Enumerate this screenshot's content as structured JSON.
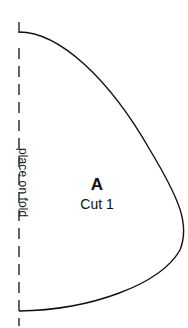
{
  "pattern_piece": {
    "letter": "A",
    "cut_instruction": "Cut 1",
    "fold_label": "place on fold",
    "line_color": "#111111",
    "background_color": "#ffffff"
  }
}
